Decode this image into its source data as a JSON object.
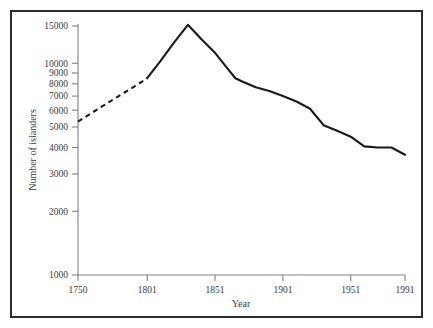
{
  "chart_data": {
    "type": "line",
    "title": "",
    "xlabel": "Year",
    "ylabel": "Number of islanders",
    "yscale": "log",
    "xlim": [
      1750,
      1991
    ],
    "ylim": [
      1000,
      16500
    ],
    "grid": false,
    "legend": null,
    "xticks": [
      1750,
      1801,
      1851,
      1901,
      1951,
      1991
    ],
    "xtick_labels": [
      "1750",
      "1801",
      "1851",
      "1901",
      "1951",
      "1991"
    ],
    "yticks": [
      1000,
      2000,
      3000,
      4000,
      5000,
      6000,
      7000,
      8000,
      9000,
      10000,
      15000
    ],
    "ytick_labels": [
      "1000",
      "2000",
      "3000",
      "4000",
      "5000",
      "6000",
      "7000",
      "8000",
      "9000",
      "10000",
      "15000"
    ],
    "series": [
      {
        "name": "Estimated population (dashed)",
        "style": "dashed",
        "color": "#1a1a1a",
        "x": [
          1750,
          1765,
          1780,
          1792,
          1801
        ],
        "values": [
          5300,
          6100,
          7000,
          7800,
          8500
        ]
      },
      {
        "name": "Recorded population (solid)",
        "style": "solid",
        "color": "#1a1a1a",
        "x": [
          1801,
          1811,
          1821,
          1831,
          1841,
          1851,
          1861,
          1866,
          1871,
          1881,
          1891,
          1901,
          1911,
          1921,
          1931,
          1941,
          1951,
          1961,
          1971,
          1981,
          1991
        ],
        "values": [
          8500,
          10300,
          12600,
          15200,
          13000,
          11200,
          9300,
          8500,
          8200,
          7700,
          7400,
          7000,
          6600,
          6100,
          5100,
          4800,
          4500,
          4050,
          4000,
          4000,
          3700
        ]
      }
    ],
    "annotations": []
  },
  "axes": {
    "y_axis_title": "Number of islanders",
    "x_axis_title": "Year"
  }
}
